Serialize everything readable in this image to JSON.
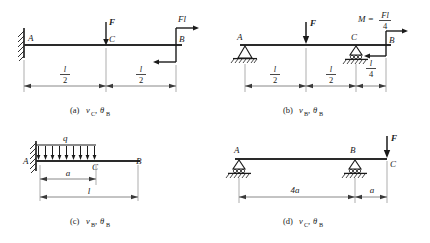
{
  "figure": {
    "type": "engineering-beam-diagrams",
    "panel_count": 4
  },
  "panels": [
    {
      "id": "a",
      "caption": "(a)",
      "caption_quantities": "v_C , θ_B",
      "caption_v": "v",
      "caption_v_sub": "C",
      "caption_theta": "θ",
      "caption_theta_sub": "B",
      "support_left": "fixed-wall",
      "support_right": "none",
      "points": [
        "A",
        "C",
        "B"
      ],
      "loads": [
        {
          "name": "F",
          "type": "point-force",
          "at": "C",
          "direction": "down"
        },
        {
          "name": "Fl",
          "type": "couple",
          "at": "B",
          "direction": "counterclockwise"
        }
      ],
      "label_A": "A",
      "label_B": "B",
      "label_C": "C",
      "label_F": "F",
      "label_couple_num": "Fl",
      "dimensions": [
        {
          "num": "l",
          "den": "2"
        },
        {
          "num": "l",
          "den": "2"
        }
      ]
    },
    {
      "id": "b",
      "caption": "(b)",
      "caption_quantities": "v_B , θ_B",
      "caption_v": "v",
      "caption_v_sub": "B",
      "caption_theta": "θ",
      "caption_theta_sub": "B",
      "support_left": "pin",
      "support_mid": "roller",
      "points": [
        "A",
        "C",
        "B"
      ],
      "loads": [
        {
          "name": "F",
          "type": "point-force",
          "at": "midspan",
          "direction": "down"
        },
        {
          "name": "M = Fl/4",
          "type": "couple",
          "at": "B",
          "direction": "counterclockwise"
        }
      ],
      "label_A": "A",
      "label_B": "B",
      "label_C": "C",
      "label_F": "F",
      "moment_lhs": "M =",
      "moment_num": "Fl",
      "moment_den": "4",
      "dimensions": [
        {
          "num": "l",
          "den": "2"
        },
        {
          "num": "l",
          "den": "2"
        },
        {
          "num": "l",
          "den": "4"
        }
      ]
    },
    {
      "id": "c",
      "caption": "(c)",
      "caption_quantities": "v_B , θ_B",
      "caption_v": "v",
      "caption_v_sub": "B",
      "caption_theta": "θ",
      "caption_theta_sub": "B",
      "support_left": "fixed-wall",
      "points": [
        "A",
        "C",
        "B"
      ],
      "loads": [
        {
          "name": "q",
          "type": "distributed-load",
          "span": "a",
          "direction": "down"
        }
      ],
      "label_A": "A",
      "label_B": "B",
      "label_C": "C",
      "label_q": "q",
      "arrow_count": 9,
      "dimensions": [
        {
          "text": "a"
        },
        {
          "text": "l"
        }
      ],
      "dim_a": "a",
      "dim_l": "l"
    },
    {
      "id": "d",
      "caption": "(d)",
      "caption_quantities": "v_C , θ_B",
      "caption_v": "v",
      "caption_v_sub": "C",
      "caption_theta": "θ",
      "caption_theta_sub": "B",
      "support_left": "roller",
      "support_mid": "roller",
      "points": [
        "A",
        "B",
        "C"
      ],
      "loads": [
        {
          "name": "F",
          "type": "point-force",
          "at": "C",
          "direction": "down"
        }
      ],
      "label_A": "A",
      "label_B": "B",
      "label_C": "C",
      "label_F": "F",
      "dim_4a": "4a",
      "dim_a": "a"
    }
  ],
  "colors": {
    "ink": "#1a1a1a",
    "beam": "#2a2a2a",
    "background": "#ffffff"
  }
}
